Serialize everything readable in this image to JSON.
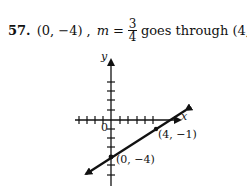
{
  "problem": {
    "number": "57.",
    "point": "(0, −4) ,",
    "slope_var": "m",
    "equals": "=",
    "slope_num": "3",
    "slope_den": "4",
    "text": "goes through (4, −1)"
  },
  "graph": {
    "x_label": "x",
    "y_label": "y",
    "origin_label": "0",
    "point_a_label": "(4, −1)",
    "point_b_label": "(0, −4)"
  }
}
